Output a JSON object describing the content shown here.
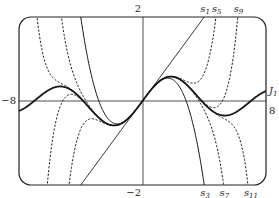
{
  "chart_data": {
    "type": "line",
    "title": "",
    "xlabel": "",
    "ylabel": "",
    "xlim": [
      -8,
      8
    ],
    "ylim": [
      -2,
      2
    ],
    "grid": false,
    "axis_labels": {
      "x_left": "−8",
      "x_right": "8",
      "y_top": "2",
      "y_bottom": "−2"
    },
    "series": [
      {
        "name": "J1",
        "label_main": "J",
        "label_sub": "1",
        "style": "solid-bold",
        "kind": "bessel",
        "label_pos": "right"
      },
      {
        "name": "s1",
        "label_main": "s",
        "label_sub": "1",
        "style": "solid",
        "degree": 1,
        "label_pos": "top"
      },
      {
        "name": "s3",
        "label_main": "s",
        "label_sub": "3",
        "style": "solid",
        "degree": 3,
        "label_pos": "bottom"
      },
      {
        "name": "s5",
        "label_main": "s",
        "label_sub": "5",
        "style": "dashed",
        "degree": 5,
        "label_pos": "top"
      },
      {
        "name": "s7",
        "label_main": "s",
        "label_sub": "7",
        "style": "dashed",
        "degree": 7,
        "label_pos": "bottom"
      },
      {
        "name": "s9",
        "label_main": "s",
        "label_sub": "9",
        "style": "dashed",
        "degree": 9,
        "label_pos": "top"
      },
      {
        "name": "s11",
        "label_main": "s",
        "label_sub": "11",
        "style": "dashed",
        "degree": 11,
        "label_pos": "bottom"
      }
    ]
  }
}
